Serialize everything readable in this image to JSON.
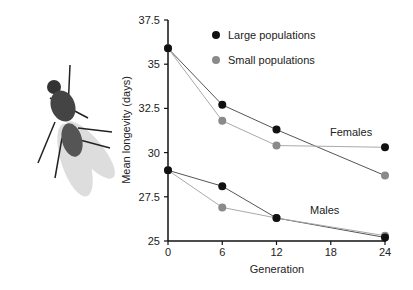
{
  "chart_data": {
    "type": "line",
    "title": "",
    "xlabel": "Generation",
    "ylabel": "Mean longevity (days)",
    "x": [
      0,
      6,
      12,
      24
    ],
    "xticks": [
      "0",
      "6",
      "12",
      "18",
      "24"
    ],
    "yticks": [
      "25",
      "27.5",
      "30",
      "32.5",
      "35",
      "37.5"
    ],
    "ylim": [
      25,
      37.5
    ],
    "xlim": [
      0,
      24
    ],
    "grid": false,
    "legend": {
      "position": "top-right",
      "entries": [
        "Large populations",
        "Small populations"
      ]
    },
    "annotations": [
      "Females",
      "Males"
    ],
    "series": [
      {
        "name": "Large populations - Females",
        "color": "#111111",
        "values": [
          35.9,
          32.7,
          31.3,
          30.3
        ]
      },
      {
        "name": "Small populations - Females",
        "color": "#8a8a8a",
        "values": [
          35.9,
          31.8,
          30.4,
          28.7
        ]
      },
      {
        "name": "Large populations - Males",
        "color": "#111111",
        "values": [
          29.0,
          28.1,
          26.3,
          25.2
        ]
      },
      {
        "name": "Small populations - Males",
        "color": "#8a8a8a",
        "values": [
          29.0,
          26.9,
          26.3,
          25.3
        ]
      }
    ]
  },
  "illustration": {
    "icon": "fly-icon"
  }
}
